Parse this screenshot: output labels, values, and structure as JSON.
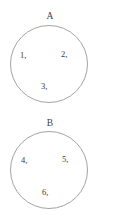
{
  "figure": {
    "type": "set-diagram",
    "background_color": "#ffffff",
    "stroke_color": "#a3a3a3",
    "text_color": "#3a3a38",
    "sets": [
      {
        "label": "A",
        "members": [
          "1,",
          "2,",
          "3,"
        ]
      },
      {
        "label": "B",
        "members": [
          "4,",
          "5,",
          "6,"
        ]
      }
    ]
  }
}
